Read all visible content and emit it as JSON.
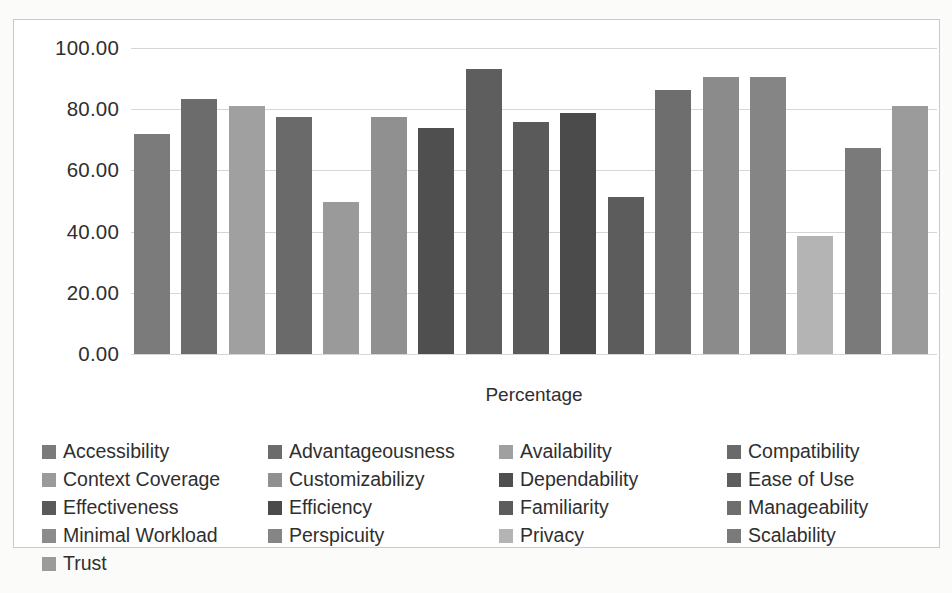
{
  "chart_data": {
    "type": "bar",
    "title": "",
    "xlabel": "Percentage",
    "ylabel": "",
    "ylim": [
      0,
      100
    ],
    "ytick_labels": [
      "100.00",
      "80.00",
      "60.00",
      "40.00",
      "20.00",
      "0.00"
    ],
    "yticks": [
      100,
      80,
      60,
      40,
      20,
      0
    ],
    "grid": true,
    "legend_position": "bottom",
    "legend_columns": 4,
    "categories": [
      "Accessibility",
      "Advantageousness",
      "Availability",
      "Compatibility",
      "Context Coverage",
      "Customizabilizy",
      "Dependability",
      "Ease of Use",
      "Effectiveness",
      "Efficiency",
      "Familiarity",
      "Manageability",
      "Minimal Workload",
      "Perspicuity",
      "Privacy",
      "Scalability",
      "Trust"
    ],
    "values": [
      72.0,
      83.5,
      81.0,
      77.3,
      49.8,
      77.3,
      74.0,
      93.3,
      75.7,
      78.8,
      51.3,
      86.2,
      90.6,
      90.4,
      38.7,
      67.3,
      81.0
    ],
    "colors": [
      "#7b7b7b",
      "#6c6c6c",
      "#a0a0a0",
      "#6a6a6a",
      "#9a9a9a",
      "#909090",
      "#4f4f4f",
      "#5e5e5e",
      "#5a5a5a",
      "#4b4b4b",
      "#5c5c5c",
      "#6e6e6e",
      "#8b8b8b",
      "#858585",
      "#b4b4b4",
      "#7a7a7a",
      "#9b9b9b"
    ]
  },
  "legend": {
    "items": [
      {
        "label": "Accessibility",
        "color": "#7b7b7b"
      },
      {
        "label": "Advantageousness",
        "color": "#6c6c6c"
      },
      {
        "label": "Availability",
        "color": "#a0a0a0"
      },
      {
        "label": "Compatibility",
        "color": "#6a6a6a"
      },
      {
        "label": "Context Coverage",
        "color": "#9a9a9a"
      },
      {
        "label": "Customizabilizy",
        "color": "#909090"
      },
      {
        "label": "Dependability",
        "color": "#4f4f4f"
      },
      {
        "label": "Ease of Use",
        "color": "#5e5e5e"
      },
      {
        "label": "Effectiveness",
        "color": "#5a5a5a"
      },
      {
        "label": "Efficiency",
        "color": "#4b4b4b"
      },
      {
        "label": "Familiarity",
        "color": "#5c5c5c"
      },
      {
        "label": "Manageability",
        "color": "#6e6e6e"
      },
      {
        "label": "Minimal Workload",
        "color": "#8b8b8b"
      },
      {
        "label": "Perspicuity",
        "color": "#858585"
      },
      {
        "label": "Privacy",
        "color": "#b4b4b4"
      },
      {
        "label": "Scalability",
        "color": "#7a7a7a"
      },
      {
        "label": "Trust",
        "color": "#9b9b9b"
      }
    ]
  }
}
